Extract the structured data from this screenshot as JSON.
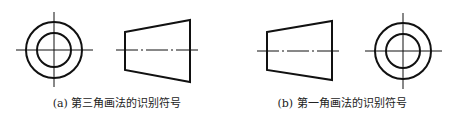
{
  "figures": [
    {
      "id": "a",
      "caption": "(a) 第三角画法的识别符号",
      "caption_center_x": 117,
      "layout": "circle-left, trapezoid-right",
      "circle": {
        "cx": 54,
        "cy": 50,
        "r_outer": 28,
        "r_inner": 17
      },
      "trapezoid": {
        "narrow_x": 125,
        "narrow_top": 32,
        "narrow_bottom": 70,
        "wide_x": 190,
        "wide_top": 20,
        "wide_bottom": 82
      }
    },
    {
      "id": "b",
      "caption": "(b) 第一角画法的识别符号",
      "caption_center_x": 342,
      "layout": "trapezoid-left, circle-right",
      "circle": {
        "cx": 403,
        "cy": 51,
        "r_outer": 28,
        "r_inner": 17
      },
      "trapezoid": {
        "narrow_x": 267,
        "narrow_top": 32,
        "narrow_bottom": 70,
        "wide_x": 332,
        "wide_top": 21,
        "wide_bottom": 80
      }
    }
  ],
  "colors": {
    "stroke": "#111111",
    "background": "#ffffff"
  }
}
